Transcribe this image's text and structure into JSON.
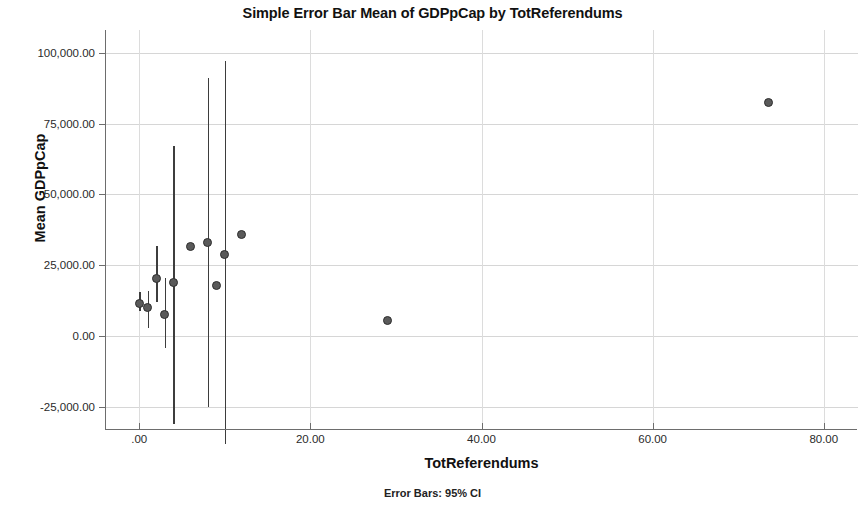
{
  "chart_data": {
    "type": "scatter",
    "title": "Simple Error Bar Mean of GDPpCap by TotReferendums",
    "xlabel": "TotReferendums",
    "ylabel": "Mean GDPpCap",
    "footnote": "Error Bars: 95% CI",
    "xlim": [
      -4,
      84
    ],
    "ylim": [
      -32000,
      108000
    ],
    "grid": true,
    "legend": false,
    "x_ticks": [
      0,
      20,
      40,
      60,
      80
    ],
    "x_tick_labels": [
      ".00",
      "20.00",
      "40.00",
      "60.00",
      "80.00"
    ],
    "y_ticks": [
      -25000,
      0,
      25000,
      50000,
      75000,
      100000
    ],
    "y_tick_labels": [
      "-25,000.00",
      "0.00",
      "25,000.00",
      "50,000.00",
      "75,000.00",
      "100,000.00"
    ],
    "marker_color": "#5a5a5a",
    "marker_edge_color": "#2e2e2e",
    "errorbar_color": "#3d3d3d",
    "grid_color": "#d6d6d6",
    "axis_color": "#6d6d6d",
    "series": [
      {
        "name": "Mean GDPpCap",
        "points": [
          {
            "x": 0,
            "y": 11500,
            "ci_low": 9000,
            "ci_high": 15500
          },
          {
            "x": 1,
            "y": 10000,
            "ci_low": 3000,
            "ci_high": 16000
          },
          {
            "x": 2,
            "y": 20500,
            "ci_low": 12000,
            "ci_high": 32000
          },
          {
            "x": 3,
            "y": 7500,
            "ci_low": -4000,
            "ci_high": 20500
          },
          {
            "x": 4,
            "y": 19000,
            "ci_low": -31000,
            "ci_high": 67000
          },
          {
            "x": 6,
            "y": 31500,
            "ci_low": null,
            "ci_high": null
          },
          {
            "x": 8,
            "y": 33000,
            "ci_low": -25000,
            "ci_high": 91000
          },
          {
            "x": 9,
            "y": 18000,
            "ci_low": null,
            "ci_high": null
          },
          {
            "x": 10,
            "y": 29000,
            "ci_low": -38000,
            "ci_high": 97000
          },
          {
            "x": 12,
            "y": 36000,
            "ci_low": null,
            "ci_high": null
          },
          {
            "x": 29,
            "y": 5500,
            "ci_low": null,
            "ci_high": null
          },
          {
            "x": 73.5,
            "y": 82500,
            "ci_low": null,
            "ci_high": null
          }
        ]
      }
    ]
  }
}
